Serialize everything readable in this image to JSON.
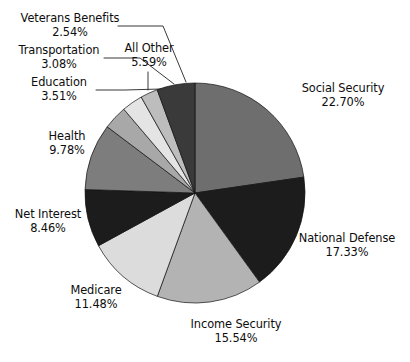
{
  "chart_data": {
    "type": "pie",
    "title": "",
    "xlabel": "",
    "ylabel": "",
    "units": "percent",
    "legend_position": "none",
    "grid": false,
    "start_angle_deg": 0,
    "direction": "clockwise",
    "total": 100.02,
    "categories": [
      "Social Security",
      "National Defense",
      "Income Security",
      "Medicare",
      "Net Interest",
      "Health",
      "Education",
      "Transportation",
      "Veterans Benefits",
      "All Other"
    ],
    "values": [
      22.7,
      17.33,
      15.54,
      11.48,
      8.46,
      9.78,
      3.51,
      3.08,
      2.54,
      5.59
    ],
    "value_labels": [
      "22.70%",
      "17.33%",
      "15.54%",
      "11.48%",
      "8.46%",
      "9.78%",
      "3.51%",
      "3.08%",
      "2.54%",
      "5.59%"
    ],
    "colors": [
      "#6e6e6e",
      "#1c1c1c",
      "#b3b3b3",
      "#dcdcdc",
      "#1c1c1c",
      "#7d7d7d",
      "#a8a8a8",
      "#e4e4e4",
      "#bdbdbd",
      "#3a3a3a"
    ]
  },
  "slices": [
    {
      "name": "Social Security",
      "percent": "22.70%"
    },
    {
      "name": "National Defense",
      "percent": "17.33%"
    },
    {
      "name": "Income Security",
      "percent": "15.54%"
    },
    {
      "name": "Medicare",
      "percent": "11.48%"
    },
    {
      "name": "Net Interest",
      "percent": "8.46%"
    },
    {
      "name": "Health",
      "percent": "9.78%"
    },
    {
      "name": "Education",
      "percent": "3.51%"
    },
    {
      "name": "Transportation",
      "percent": "3.08%"
    },
    {
      "name": "Veterans Benefits",
      "percent": "2.54%"
    },
    {
      "name": "All Other",
      "percent": "5.59%"
    }
  ],
  "geometry": {
    "center_x": 195,
    "center_y": 193,
    "radius": 110
  }
}
